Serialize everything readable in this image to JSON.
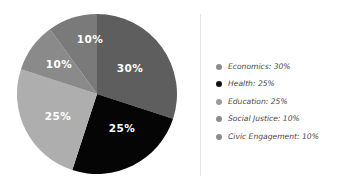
{
  "chart_data": {
    "type": "pie",
    "title": "",
    "subtitle": "",
    "xlabel": "",
    "ylabel": "",
    "legend_position": "right",
    "grid": false,
    "start_angle_deg": 0,
    "direction": "clockwise",
    "categories": [
      "Economics",
      "Health",
      "Education",
      "Social Justice",
      "Civic Engagement"
    ],
    "values": [
      30,
      25,
      25,
      10,
      10
    ],
    "slice_labels": [
      "30%",
      "25%",
      "25%",
      "10%",
      "10%"
    ],
    "colors": [
      "#5e5e5e",
      "#050505",
      "#aeaeae",
      "#8a8a8a",
      "#7a7a7a"
    ],
    "slices": [
      {
        "name": "Economics",
        "value": 30,
        "label": "30%",
        "color": "#5e5e5e",
        "legend_dot_color": "#8c8c8c",
        "label_x": 130,
        "label_y": 69
      },
      {
        "name": "Health",
        "value": 25,
        "label": "25%",
        "color": "#050505",
        "legend_dot_color": "#111111",
        "label_x": 122,
        "label_y": 129
      },
      {
        "name": "Education",
        "value": 25,
        "label": "25%",
        "color": "#aeaeae",
        "legend_dot_color": "#9b9b9b",
        "label_x": 58,
        "label_y": 117
      },
      {
        "name": "Social Justice",
        "value": 10,
        "label": "10%",
        "color": "#8a8a8a",
        "legend_dot_color": "#8c8c8c",
        "label_x": 59,
        "label_y": 65
      },
      {
        "name": "Civic Engagement",
        "value": 10,
        "label": "10%",
        "color": "#7a7a7a",
        "legend_dot_color": "#8c8c8c",
        "label_x": 90,
        "label_y": 40
      }
    ]
  },
  "legend": {
    "items": [
      {
        "label": "Economics: 30%",
        "dot_color": "#8c8c8c"
      },
      {
        "label": "Health: 25%",
        "dot_color": "#111111"
      },
      {
        "label": "Education: 25%",
        "dot_color": "#9b9b9b"
      },
      {
        "label": "Social Justice: 10%",
        "dot_color": "#8c8c8c"
      },
      {
        "label": "Civic Engagement: 10%",
        "dot_color": "#8c8c8c"
      }
    ]
  },
  "style": {
    "background": "#ffffff",
    "divider_color": "#e3e3e3",
    "label_text_color": "#ffffff",
    "legend_text_color": "#4a4a4a"
  },
  "geometry": {
    "center_x": 97,
    "center_y": 94,
    "radius": 80
  }
}
